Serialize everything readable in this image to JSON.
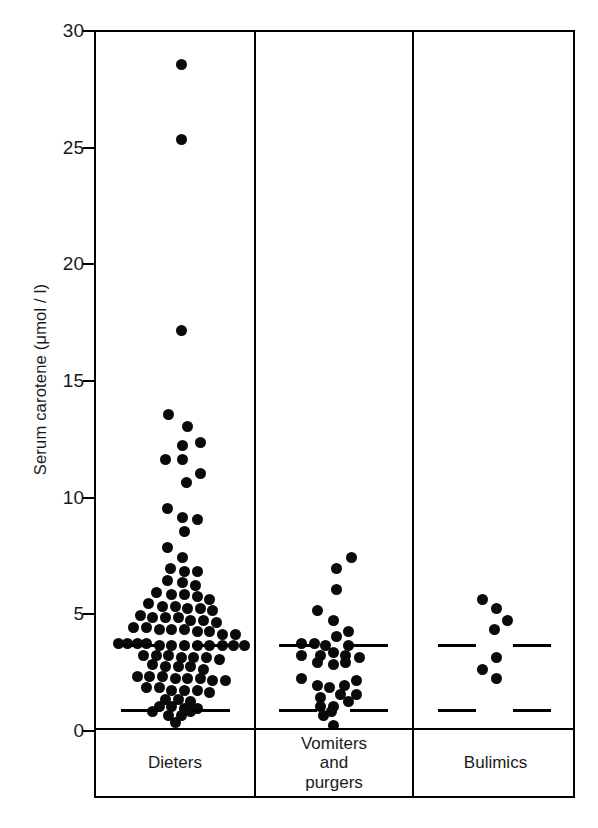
{
  "chart_data": {
    "type": "scatter",
    "title": "",
    "subtitle": "",
    "xlabel": "",
    "ylabel": "Serum carotene (μmol / l)",
    "ylim": [
      0,
      30
    ],
    "yticks": [
      0,
      5,
      10,
      15,
      20,
      25,
      30
    ],
    "ytick_labels": [
      "0",
      "5",
      "10",
      "15",
      "20",
      "25",
      "30"
    ],
    "grid": false,
    "legend": "none",
    "plot_style": "dot-plot / strip-plot with jittered points, three vertical panels",
    "annotations": [
      {
        "name": "upper-reference-line",
        "style": "dashed horizontal line spanning all panels",
        "value": 3.7
      },
      {
        "name": "lower-reference-line",
        "style": "dashed horizontal line spanning all panels",
        "value": 0.9
      }
    ],
    "categories": [
      "Dieters",
      "Vomiters and purgers",
      "Bulimics"
    ],
    "groups": [
      {
        "name": "Dieters",
        "label_lines": [
          "Dieters"
        ],
        "n": 100,
        "points": [
          {
            "x": 0.54,
            "y": 28.6
          },
          {
            "x": 0.54,
            "y": 25.4
          },
          {
            "x": 0.54,
            "y": 17.2
          },
          {
            "x": 0.46,
            "y": 13.6
          },
          {
            "x": 0.58,
            "y": 13.1
          },
          {
            "x": 0.55,
            "y": 12.3
          },
          {
            "x": 0.66,
            "y": 12.4
          },
          {
            "x": 0.44,
            "y": 11.7
          },
          {
            "x": 0.55,
            "y": 11.7
          },
          {
            "x": 0.66,
            "y": 11.1
          },
          {
            "x": 0.57,
            "y": 10.7
          },
          {
            "x": 0.45,
            "y": 9.6
          },
          {
            "x": 0.55,
            "y": 9.2
          },
          {
            "x": 0.64,
            "y": 9.1
          },
          {
            "x": 0.56,
            "y": 8.6
          },
          {
            "x": 0.45,
            "y": 7.9
          },
          {
            "x": 0.55,
            "y": 7.5
          },
          {
            "x": 0.47,
            "y": 7.0
          },
          {
            "x": 0.56,
            "y": 6.9
          },
          {
            "x": 0.64,
            "y": 6.9
          },
          {
            "x": 0.45,
            "y": 6.5
          },
          {
            "x": 0.55,
            "y": 6.4
          },
          {
            "x": 0.63,
            "y": 6.3
          },
          {
            "x": 0.38,
            "y": 6.0
          },
          {
            "x": 0.48,
            "y": 5.9
          },
          {
            "x": 0.56,
            "y": 5.9
          },
          {
            "x": 0.64,
            "y": 5.8
          },
          {
            "x": 0.72,
            "y": 5.7
          },
          {
            "x": 0.33,
            "y": 5.5
          },
          {
            "x": 0.42,
            "y": 5.4
          },
          {
            "x": 0.5,
            "y": 5.4
          },
          {
            "x": 0.58,
            "y": 5.3
          },
          {
            "x": 0.66,
            "y": 5.3
          },
          {
            "x": 0.74,
            "y": 5.2
          },
          {
            "x": 0.28,
            "y": 5.0
          },
          {
            "x": 0.36,
            "y": 4.9
          },
          {
            "x": 0.44,
            "y": 4.9
          },
          {
            "x": 0.52,
            "y": 4.9
          },
          {
            "x": 0.6,
            "y": 4.8
          },
          {
            "x": 0.68,
            "y": 4.8
          },
          {
            "x": 0.76,
            "y": 4.7
          },
          {
            "x": 0.24,
            "y": 4.5
          },
          {
            "x": 0.32,
            "y": 4.5
          },
          {
            "x": 0.4,
            "y": 4.4
          },
          {
            "x": 0.48,
            "y": 4.4
          },
          {
            "x": 0.56,
            "y": 4.4
          },
          {
            "x": 0.64,
            "y": 4.3
          },
          {
            "x": 0.72,
            "y": 4.3
          },
          {
            "x": 0.8,
            "y": 4.2
          },
          {
            "x": 0.88,
            "y": 4.2
          },
          {
            "x": 0.14,
            "y": 3.8
          },
          {
            "x": 0.2,
            "y": 3.8
          },
          {
            "x": 0.26,
            "y": 3.8
          },
          {
            "x": 0.32,
            "y": 3.8
          },
          {
            "x": 0.4,
            "y": 3.7
          },
          {
            "x": 0.48,
            "y": 3.7
          },
          {
            "x": 0.56,
            "y": 3.7
          },
          {
            "x": 0.64,
            "y": 3.7
          },
          {
            "x": 0.72,
            "y": 3.7
          },
          {
            "x": 0.8,
            "y": 3.7
          },
          {
            "x": 0.87,
            "y": 3.7
          },
          {
            "x": 0.94,
            "y": 3.7
          },
          {
            "x": 0.3,
            "y": 3.3
          },
          {
            "x": 0.38,
            "y": 3.3
          },
          {
            "x": 0.46,
            "y": 3.3
          },
          {
            "x": 0.54,
            "y": 3.2
          },
          {
            "x": 0.62,
            "y": 3.2
          },
          {
            "x": 0.7,
            "y": 3.2
          },
          {
            "x": 0.78,
            "y": 3.1
          },
          {
            "x": 0.36,
            "y": 2.9
          },
          {
            "x": 0.44,
            "y": 2.8
          },
          {
            "x": 0.52,
            "y": 2.8
          },
          {
            "x": 0.6,
            "y": 2.8
          },
          {
            "x": 0.68,
            "y": 2.7
          },
          {
            "x": 0.26,
            "y": 2.4
          },
          {
            "x": 0.34,
            "y": 2.4
          },
          {
            "x": 0.42,
            "y": 2.4
          },
          {
            "x": 0.5,
            "y": 2.3
          },
          {
            "x": 0.58,
            "y": 2.3
          },
          {
            "x": 0.66,
            "y": 2.3
          },
          {
            "x": 0.74,
            "y": 2.2
          },
          {
            "x": 0.82,
            "y": 2.2
          },
          {
            "x": 0.32,
            "y": 1.9
          },
          {
            "x": 0.4,
            "y": 1.9
          },
          {
            "x": 0.48,
            "y": 1.8
          },
          {
            "x": 0.56,
            "y": 1.8
          },
          {
            "x": 0.64,
            "y": 1.8
          },
          {
            "x": 0.72,
            "y": 1.7
          },
          {
            "x": 0.44,
            "y": 1.4
          },
          {
            "x": 0.52,
            "y": 1.4
          },
          {
            "x": 0.6,
            "y": 1.3
          },
          {
            "x": 0.4,
            "y": 1.1
          },
          {
            "x": 0.48,
            "y": 1.1
          },
          {
            "x": 0.56,
            "y": 1.0
          },
          {
            "x": 0.64,
            "y": 1.0
          },
          {
            "x": 0.46,
            "y": 0.7
          },
          {
            "x": 0.54,
            "y": 0.7
          },
          {
            "x": 0.5,
            "y": 0.4
          },
          {
            "x": 0.6,
            "y": 0.9
          },
          {
            "x": 0.36,
            "y": 0.9
          }
        ]
      },
      {
        "name": "Vomiters and purgers",
        "label_lines": [
          "Vomiters",
          "and",
          "purgers"
        ],
        "n": 33,
        "points": [
          {
            "x": 0.62,
            "y": 7.5
          },
          {
            "x": 0.52,
            "y": 7.0
          },
          {
            "x": 0.52,
            "y": 6.1
          },
          {
            "x": 0.4,
            "y": 5.2
          },
          {
            "x": 0.5,
            "y": 4.8
          },
          {
            "x": 0.6,
            "y": 4.3
          },
          {
            "x": 0.52,
            "y": 4.1
          },
          {
            "x": 0.3,
            "y": 3.8
          },
          {
            "x": 0.38,
            "y": 3.8
          },
          {
            "x": 0.45,
            "y": 3.7
          },
          {
            "x": 0.6,
            "y": 3.7
          },
          {
            "x": 0.3,
            "y": 3.3
          },
          {
            "x": 0.42,
            "y": 3.3
          },
          {
            "x": 0.5,
            "y": 3.4
          },
          {
            "x": 0.58,
            "y": 3.3
          },
          {
            "x": 0.67,
            "y": 3.2
          },
          {
            "x": 0.4,
            "y": 3.0
          },
          {
            "x": 0.5,
            "y": 2.9
          },
          {
            "x": 0.58,
            "y": 3.0
          },
          {
            "x": 0.3,
            "y": 2.3
          },
          {
            "x": 0.65,
            "y": 2.2
          },
          {
            "x": 0.4,
            "y": 2.0
          },
          {
            "x": 0.48,
            "y": 1.9
          },
          {
            "x": 0.57,
            "y": 2.0
          },
          {
            "x": 0.65,
            "y": 1.6
          },
          {
            "x": 0.42,
            "y": 1.5
          },
          {
            "x": 0.55,
            "y": 1.6
          },
          {
            "x": 0.6,
            "y": 1.3
          },
          {
            "x": 0.42,
            "y": 1.1
          },
          {
            "x": 0.5,
            "y": 1.1
          },
          {
            "x": 0.44,
            "y": 0.7
          },
          {
            "x": 0.5,
            "y": 0.3
          },
          {
            "x": 0.49,
            "y": 0.9
          }
        ]
      },
      {
        "name": "Bulimics",
        "label_lines": [
          "Bulimics"
        ],
        "n": 7,
        "points": [
          {
            "x": 0.43,
            "y": 5.7
          },
          {
            "x": 0.51,
            "y": 5.3
          },
          {
            "x": 0.58,
            "y": 4.8
          },
          {
            "x": 0.5,
            "y": 4.4
          },
          {
            "x": 0.51,
            "y": 3.2
          },
          {
            "x": 0.43,
            "y": 2.7
          },
          {
            "x": 0.51,
            "y": 2.3
          }
        ]
      }
    ]
  },
  "axis": {
    "y_label": "Serum carotene (μmol / l)",
    "tick_labels": [
      "30",
      "25",
      "20",
      "15",
      "10",
      "5",
      "0"
    ]
  },
  "group_labels": [
    {
      "id": "dieters",
      "lines": [
        "Dieters"
      ]
    },
    {
      "id": "vomiters-and-purgers",
      "lines": [
        "Vomiters",
        "and",
        "purgers"
      ]
    },
    {
      "id": "bulimics",
      "lines": [
        "Bulimics"
      ]
    }
  ],
  "colors": {
    "ink": "#0a0a0a",
    "background": "#ffffff",
    "dot": "#0a0a0a"
  }
}
